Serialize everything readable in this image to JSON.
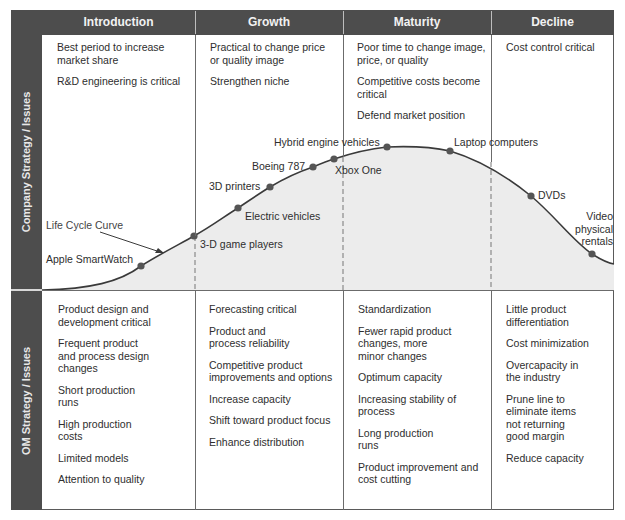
{
  "header": {
    "columns": [
      "Introduction",
      "Growth",
      "Maturity",
      "Decline"
    ]
  },
  "rows": {
    "company": {
      "label": "Company Strategy / Issues",
      "cells": [
        [
          "Best period to increase market share",
          "R&D engineering is critical"
        ],
        [
          "Practical to change price or quality image",
          "Strengthen niche"
        ],
        [
          "Poor time to change image, price, or quality",
          "Competitive costs become critical",
          "Defend market position"
        ],
        [
          "Cost control critical"
        ]
      ]
    },
    "om": {
      "label": "OM Strategy / Issues",
      "cells": [
        [
          "Product design and development critical",
          "Frequent product and process design changes",
          "Short production runs",
          "High production costs",
          "Limited models",
          "Attention to quality"
        ],
        [
          "Forecasting critical",
          "Product and process reliability",
          "Competitive product improvements and options",
          "Increase capacity",
          "Shift toward product focus",
          "Enhance distribution"
        ],
        [
          "Standardization",
          "Fewer rapid product changes, more minor changes",
          "Optimum capacity",
          "Increasing stability of process",
          "Long production runs",
          "Product improvement and cost cutting"
        ],
        [
          "Little product differentiation",
          "Cost minimization",
          "Overcapacity in the industry",
          "Prune line to eliminate items not returning good margin",
          "Reduce capacity"
        ]
      ]
    }
  },
  "curve": {
    "label": "Life Cycle Curve",
    "points": [
      {
        "name": "Apple SmartWatch",
        "stage": "Introduction"
      },
      {
        "name": "3-D game players",
        "stage": "Introduction/Growth boundary"
      },
      {
        "name": "Electric vehicles",
        "stage": "Growth"
      },
      {
        "name": "3D printers",
        "stage": "Growth"
      },
      {
        "name": "Boeing 787",
        "stage": "Growth"
      },
      {
        "name": "Xbox One",
        "stage": "Growth/Maturity boundary"
      },
      {
        "name": "Hybrid engine vehicles",
        "stage": "Maturity"
      },
      {
        "name": "Laptop computers",
        "stage": "Maturity"
      },
      {
        "name": "DVDs",
        "stage": "Decline"
      },
      {
        "name": "Video physical rentals",
        "stage": "Decline"
      }
    ]
  },
  "colors": {
    "header_bg": "#4d4d4d",
    "header_text": "#f2f2f2",
    "curve_fill": "#ececec",
    "curve_line": "#3a3a3a",
    "point": "#555555"
  }
}
